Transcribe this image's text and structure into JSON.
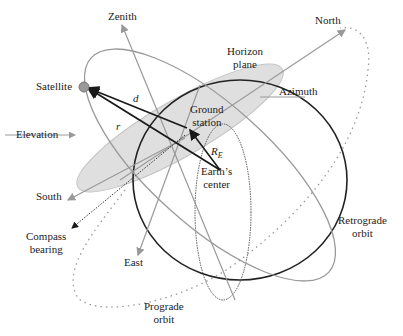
{
  "diagram": {
    "type": "satellite-ground-station geometry",
    "labels": {
      "zenith": "Zenith",
      "north": "North",
      "horizon_plane_line1": "Horizon",
      "horizon_plane_line2": "plane",
      "satellite": "Satellite",
      "azimuth": "Azimuth",
      "d_vector": "d",
      "ground_station_line1": "Ground",
      "ground_station_line2": "station",
      "r_vector": "r",
      "elevation": "Elevation",
      "re_vector": "R",
      "re_subscript": "E",
      "earths_center_line1": "Earth’s",
      "earths_center_line2": "center",
      "south": "South",
      "compass_bearing_line1": "Compass",
      "compass_bearing_line2": "bearing",
      "east": "East",
      "retrograde_line1": "Retrograde",
      "retrograde_line2": "orbit",
      "prograde_line1": "Prograde",
      "prograde_line2": "orbit"
    },
    "colors": {
      "earth_outline": "#222222",
      "orbit_gray": "#9a9a9a",
      "horizon_fill": "#dcdcdc",
      "vector": "#1a1a1a"
    }
  }
}
